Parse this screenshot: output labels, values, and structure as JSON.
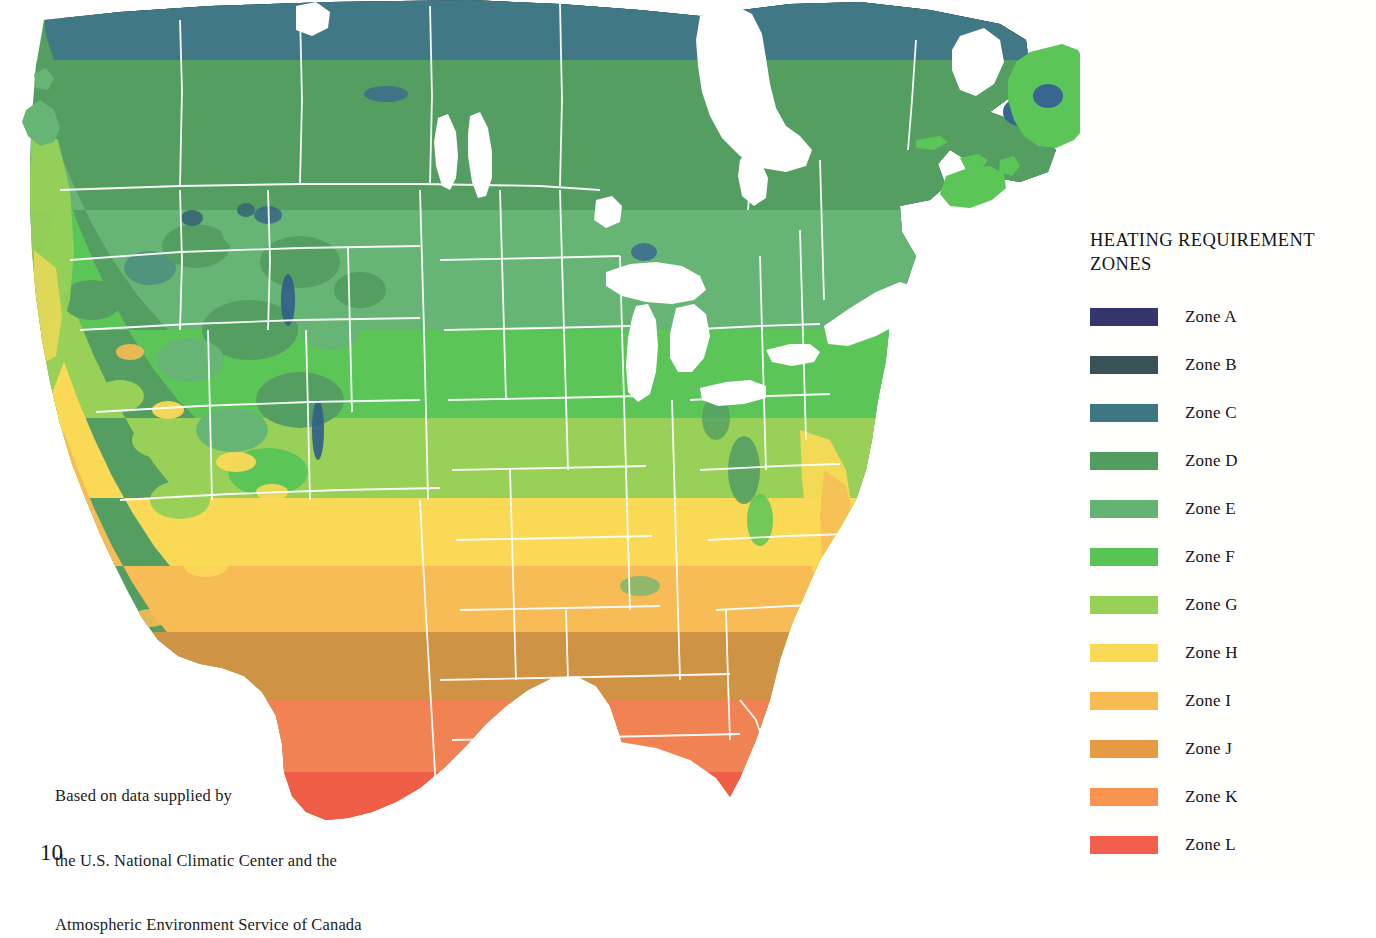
{
  "page": {
    "page_number": "10",
    "background_color": "#ffffff"
  },
  "attribution": {
    "line1": "Based on data supplied by",
    "line2": "the U.S. National Climatic Center and the",
    "line3": "Atmospheric Environment Service of Canada"
  },
  "legend": {
    "title": "HEATING REQUIREMENT ZONES",
    "title_line1": "HEATING REQUIREMENT",
    "title_line2": "ZONES",
    "items": [
      {
        "label": "Zone A",
        "color": "#33356b"
      },
      {
        "label": "Zone B",
        "color": "#3a5158"
      },
      {
        "label": "Zone C",
        "color": "#3d7783"
      },
      {
        "label": "Zone D",
        "color": "#519d5f"
      },
      {
        "label": "Zone E",
        "color": "#63b472"
      },
      {
        "label": "Zone F",
        "color": "#58c455"
      },
      {
        "label": "Zone G",
        "color": "#97d155"
      },
      {
        "label": "Zone H",
        "color": "#fad954"
      },
      {
        "label": "Zone I",
        "color": "#f7bb52"
      },
      {
        "label": "Zone J",
        "color": "#e79a44"
      },
      {
        "label": "Zone K",
        "color": "#f89350"
      },
      {
        "label": "Zone L",
        "color": "#f2604c"
      }
    ]
  },
  "map": {
    "title": "Heating Requirement Zones of the United States and Canada",
    "water_color": "#ffffff",
    "border_color": "#ffffff",
    "lake_color": "#36638f",
    "zone_colors": {
      "A": "#33356b",
      "B": "#3a5158",
      "C": "#3d7783",
      "D": "#519d5f",
      "E": "#63b472",
      "F": "#58c455",
      "G": "#97d155",
      "H": "#fad954",
      "I": "#f7bb52",
      "J": "#cf9142",
      "K": "#f08050",
      "L": "#ef5a43"
    },
    "features": {
      "great_lakes": "Great Lakes",
      "hudson_bay": "Hudson Bay",
      "gulf_of_mexico": "Gulf of Mexico",
      "pacific_ocean": "Pacific Ocean",
      "atlantic_ocean": "Atlantic Ocean",
      "newfoundland": "Newfoundland"
    }
  }
}
